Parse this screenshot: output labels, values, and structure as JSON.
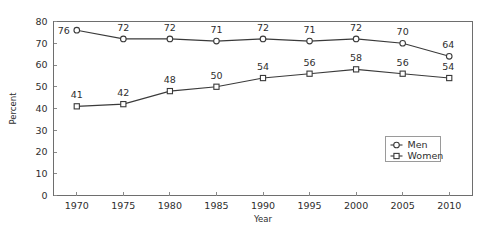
{
  "chart_data": {
    "type": "line",
    "title": "",
    "subtitle": "",
    "xlabel": "Year",
    "ylabel": "Percent",
    "x": [
      1970,
      1975,
      1980,
      1985,
      1990,
      1995,
      2000,
      2005,
      2010
    ],
    "categories": [
      "1970",
      "1975",
      "1980",
      "1985",
      "1990",
      "1995",
      "2000",
      "2005",
      "2010"
    ],
    "series": [
      {
        "name": "Men",
        "marker": "open-circle",
        "values": [
          76,
          72,
          72,
          71,
          72,
          71,
          72,
          70,
          64
        ],
        "labels": [
          "76",
          "72",
          "72",
          "71",
          "72",
          "71",
          "72",
          "70",
          "64"
        ]
      },
      {
        "name": "Women",
        "marker": "open-square",
        "values": [
          41,
          42,
          48,
          50,
          54,
          56,
          58,
          56,
          54
        ],
        "labels": [
          "41",
          "42",
          "48",
          "50",
          "54",
          "56",
          "58",
          "56",
          "54"
        ]
      }
    ],
    "ylim": [
      0,
      80
    ],
    "yticks": [
      0,
      10,
      20,
      30,
      40,
      50,
      60,
      70,
      80
    ],
    "ytick_labels": [
      "0",
      "10",
      "20",
      "30",
      "40",
      "50",
      "60",
      "70",
      "80"
    ],
    "xlim": [
      1967.5,
      2012.5
    ],
    "grid": false,
    "legend_position": "bottom-right",
    "legend_entries": [
      "Men",
      "Women"
    ],
    "colors": {
      "line": "#3a3a3a",
      "marker_fill": "#ffffff",
      "axis": "#6e6e6e",
      "text": "#2e2e2e",
      "background": "#ffffff"
    }
  }
}
